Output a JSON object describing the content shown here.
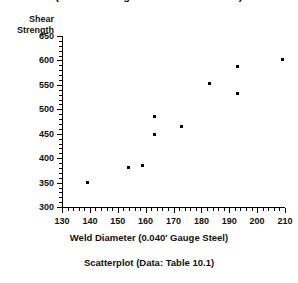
{
  "figure": {
    "title_cropped": "(Shear Strength vs Weld Diameter)",
    "caption": "Scatterplot  (Data:  Table 10.1)"
  },
  "chart_data": {
    "type": "scatter",
    "title": "",
    "xlabel": "Weld Diameter   (0.040ʹ Gauge Steel)",
    "ylabel_line1": "Shear",
    "ylabel_line2": "Strength",
    "xlim": [
      130,
      210
    ],
    "ylim": [
      300,
      650
    ],
    "xticks": [
      130,
      140,
      150,
      160,
      170,
      180,
      190,
      200,
      210
    ],
    "yticks": [
      300,
      350,
      400,
      450,
      500,
      550,
      600,
      650
    ],
    "x_minor_step": 2,
    "y_minor_step": 10,
    "grid": false,
    "legend": null,
    "marker": "square",
    "marker_color": "#000000",
    "x": [
      139,
      154,
      159,
      163,
      163,
      173,
      183,
      193,
      193,
      209
    ],
    "y": [
      350,
      380,
      385,
      448,
      485,
      465,
      552,
      532,
      588,
      602
    ],
    "points": [
      {
        "x": 139,
        "y": 350
      },
      {
        "x": 154,
        "y": 380
      },
      {
        "x": 159,
        "y": 385
      },
      {
        "x": 163,
        "y": 448
      },
      {
        "x": 163,
        "y": 485
      },
      {
        "x": 173,
        "y": 465
      },
      {
        "x": 183,
        "y": 552
      },
      {
        "x": 193,
        "y": 532
      },
      {
        "x": 193,
        "y": 588
      },
      {
        "x": 209,
        "y": 602
      }
    ]
  }
}
